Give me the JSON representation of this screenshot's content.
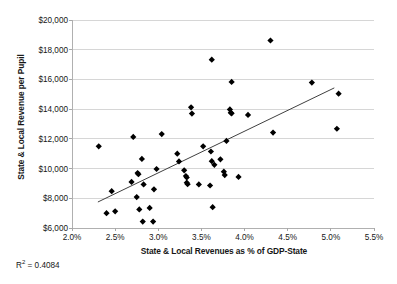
{
  "chart_data": {
    "type": "scatter",
    "title": "",
    "xlabel": "State & Local Revenues as % of GDP-State",
    "ylabel": "State & Local Revenue per Pupil",
    "xlim": [
      2.0,
      5.5
    ],
    "ylim": [
      6000,
      20000
    ],
    "x_ticks": [
      2.0,
      2.5,
      3.0,
      3.5,
      4.0,
      4.5,
      5.0,
      5.5
    ],
    "x_tick_labels": [
      "2.0%",
      "2.5%",
      "3.0%",
      "3.5%",
      "4.0%",
      "4.5%",
      "5.0%",
      "5.5%"
    ],
    "y_ticks": [
      6000,
      8000,
      10000,
      12000,
      14000,
      16000,
      18000,
      20000
    ],
    "y_tick_labels": [
      "$6,000",
      "$8,000",
      "$10,000",
      "$12,000",
      "$14,000",
      "$16,000",
      "$18,000",
      "$20,000"
    ],
    "grid": "horizontal",
    "legend": "none",
    "annotations": [
      {
        "name": "r-squared",
        "text": "R² = 0.4084",
        "value": 0.4084
      }
    ],
    "marker": {
      "shape": "diamond",
      "color": "#000000",
      "size": 4
    },
    "trendline": {
      "type": "linear",
      "color": "#404040",
      "x_start": 2.3,
      "y_start": 7750,
      "x_end": 5.04,
      "y_end": 15430
    },
    "points": [
      {
        "x": 2.31,
        "y": 11500
      },
      {
        "x": 2.4,
        "y": 7000
      },
      {
        "x": 2.46,
        "y": 8480
      },
      {
        "x": 2.5,
        "y": 7120
      },
      {
        "x": 2.69,
        "y": 9100
      },
      {
        "x": 2.71,
        "y": 12130
      },
      {
        "x": 2.75,
        "y": 8080
      },
      {
        "x": 2.76,
        "y": 9700
      },
      {
        "x": 2.77,
        "y": 9620
      },
      {
        "x": 2.78,
        "y": 7250
      },
      {
        "x": 2.81,
        "y": 10650
      },
      {
        "x": 2.82,
        "y": 6430
      },
      {
        "x": 2.83,
        "y": 8930
      },
      {
        "x": 2.9,
        "y": 7350
      },
      {
        "x": 2.94,
        "y": 6430
      },
      {
        "x": 2.95,
        "y": 8600
      },
      {
        "x": 2.98,
        "y": 9970
      },
      {
        "x": 3.04,
        "y": 12320
      },
      {
        "x": 3.22,
        "y": 11000
      },
      {
        "x": 3.24,
        "y": 10480
      },
      {
        "x": 3.3,
        "y": 9880
      },
      {
        "x": 3.32,
        "y": 9500
      },
      {
        "x": 3.33,
        "y": 9400
      },
      {
        "x": 3.33,
        "y": 9050
      },
      {
        "x": 3.34,
        "y": 8950
      },
      {
        "x": 3.38,
        "y": 14120
      },
      {
        "x": 3.39,
        "y": 13700
      },
      {
        "x": 3.47,
        "y": 8930
      },
      {
        "x": 3.52,
        "y": 11500
      },
      {
        "x": 3.6,
        "y": 8860
      },
      {
        "x": 3.61,
        "y": 11150
      },
      {
        "x": 3.62,
        "y": 10500
      },
      {
        "x": 3.62,
        "y": 17330
      },
      {
        "x": 3.63,
        "y": 7400
      },
      {
        "x": 3.65,
        "y": 10250
      },
      {
        "x": 3.72,
        "y": 10620
      },
      {
        "x": 3.76,
        "y": 9790
      },
      {
        "x": 3.77,
        "y": 9560
      },
      {
        "x": 3.79,
        "y": 11860
      },
      {
        "x": 3.83,
        "y": 13980
      },
      {
        "x": 3.84,
        "y": 13760
      },
      {
        "x": 3.85,
        "y": 13720
      },
      {
        "x": 3.85,
        "y": 15830
      },
      {
        "x": 3.93,
        "y": 9440
      },
      {
        "x": 4.04,
        "y": 13610
      },
      {
        "x": 4.3,
        "y": 18620
      },
      {
        "x": 4.33,
        "y": 12420
      },
      {
        "x": 4.78,
        "y": 15790
      },
      {
        "x": 5.07,
        "y": 12680
      },
      {
        "x": 5.09,
        "y": 15040
      }
    ]
  },
  "axis": {
    "y_title": "State & Local Revenue per Pupil",
    "x_title": "State & Local Revenues as % of GDP-State"
  },
  "footnote": {
    "r_squared_prefix": "R",
    "r_squared_sup": "2",
    "r_squared_rest": " = 0.4084"
  }
}
